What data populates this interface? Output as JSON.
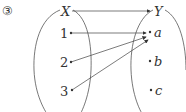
{
  "problem_number": "③",
  "domain_set": {
    "label": "X",
    "elements": [
      "1",
      "2",
      "3"
    ]
  },
  "codomain_set": {
    "label": "Y",
    "elements": [
      "a",
      "b",
      "c"
    ]
  },
  "mappings": [
    {
      "from": "1",
      "to": "a"
    },
    {
      "from": "2",
      "to": "a"
    },
    {
      "from": "3",
      "to": "a"
    }
  ],
  "colors": {
    "stroke": "#444444",
    "text": "#333333"
  }
}
